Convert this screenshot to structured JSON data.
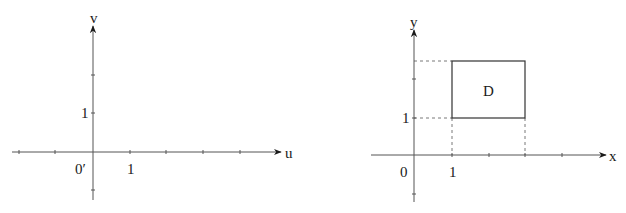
{
  "left_panel": {
    "horizontal_axis_label": "u",
    "vertical_axis_label": "v",
    "origin_label": "0′",
    "x_tick_label": "1",
    "y_tick_label": "1"
  },
  "right_panel": {
    "horizontal_axis_label": "x",
    "vertical_axis_label": "y",
    "origin_label": "0",
    "x_tick_label": "1",
    "y_tick_label": "1",
    "region_label": "D"
  },
  "colors": {
    "axis": "#555555",
    "ink": "#1a1a1a"
  }
}
